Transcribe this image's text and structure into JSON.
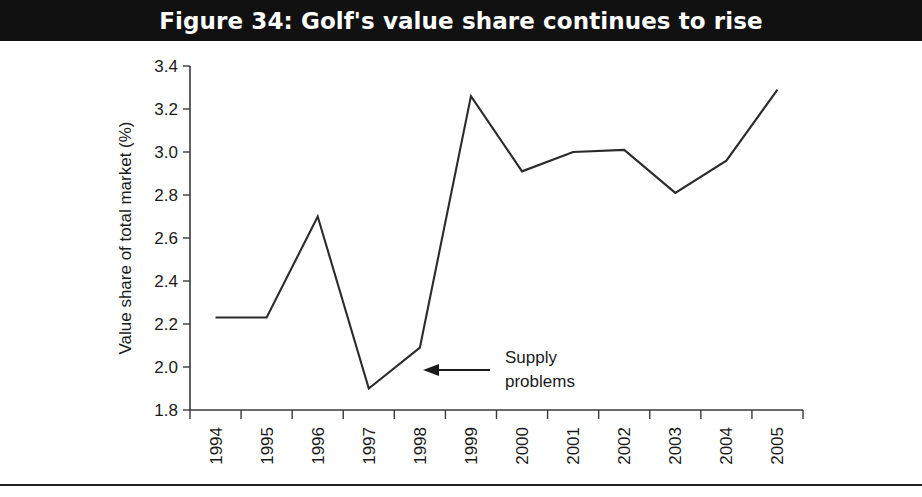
{
  "figure": {
    "title": "Figure 34: Golf's value share continues to rise"
  },
  "chart_data": {
    "type": "line",
    "title": "Figure 34: Golf's value share continues to rise",
    "xlabel": "",
    "ylabel": "Value share of total market (%)",
    "categories": [
      "1994",
      "1995",
      "1996",
      "1997",
      "1998",
      "1999",
      "2000",
      "2001",
      "2002",
      "2003",
      "2004",
      "2005"
    ],
    "values": [
      2.23,
      2.23,
      2.7,
      1.9,
      2.09,
      3.26,
      2.91,
      3.0,
      3.01,
      2.81,
      2.96,
      3.29
    ],
    "series": [
      {
        "name": "Value share of total market (%)",
        "values": [
          2.23,
          2.23,
          2.7,
          1.9,
          2.09,
          3.26,
          2.91,
          3.0,
          3.01,
          2.81,
          2.96,
          3.29
        ],
        "color": "#2b2b2b"
      }
    ],
    "ylim": [
      1.8,
      3.4
    ],
    "yticks": [
      "1.8",
      "2.0",
      "2.2",
      "2.4",
      "2.6",
      "2.8",
      "3.0",
      "3.2",
      "3.4"
    ],
    "ytick_values": [
      1.8,
      2.0,
      2.2,
      2.4,
      2.6,
      2.8,
      3.0,
      3.2,
      3.4
    ],
    "xtick_rotation": -90,
    "grid": false,
    "legend": false,
    "legend_position": "none",
    "annotations": [
      {
        "text_lines": [
          "Supply",
          "problems"
        ],
        "text": "Supply problems",
        "arrow": "left",
        "points_to_category": "1998"
      }
    ]
  },
  "colors": {
    "banner_background": "#111111",
    "banner_text": "#ffffff",
    "line": "#2b2b2b",
    "axis": "#3a3a3a",
    "text": "#1a1a1a",
    "page_background": "#ffffff"
  }
}
